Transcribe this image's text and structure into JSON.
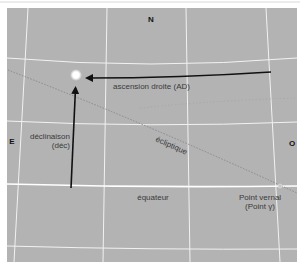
{
  "colors": {
    "sky": "#b3b3b3",
    "grid": "#f4f4f4",
    "frame": "#ffffff",
    "arrow": "#111111",
    "ecliptic": "#8a8a8a",
    "star": "#ffffff"
  },
  "cardinals": {
    "north": "N",
    "east": "E",
    "west": "O"
  },
  "labels": {
    "right_ascension": "ascension droite (AD)",
    "declination_line1": "déclinaison",
    "declination_line2": "(déc)",
    "ecliptic": "écliptique",
    "equator": "équateur",
    "vernal_line1": "Point vernal",
    "vernal_line2": "(Point γ)"
  },
  "icons": {
    "star": "star-icon",
    "vernal_point": "vernal-point-marker"
  }
}
